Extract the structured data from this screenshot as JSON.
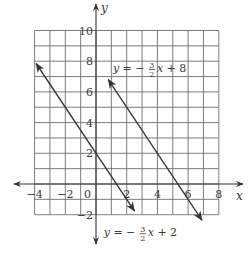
{
  "chart_data": {
    "type": "line",
    "title": "",
    "xlabel": "x",
    "ylabel": "y",
    "xlim": [
      -4,
      8
    ],
    "ylim": [
      -2,
      10
    ],
    "grid": true,
    "grid_step": 1,
    "x_ticks": [
      {
        "value": -4,
        "label": "−4"
      },
      {
        "value": -2,
        "label": "−2"
      },
      {
        "value": 0,
        "label": "0"
      },
      {
        "value": 2,
        "label": "2"
      },
      {
        "value": 4,
        "label": "4"
      },
      {
        "value": 6,
        "label": "6"
      },
      {
        "value": 8,
        "label": "8"
      }
    ],
    "y_ticks": [
      {
        "value": -2,
        "label": "−2"
      },
      {
        "value": 2,
        "label": "2"
      },
      {
        "value": 4,
        "label": "4"
      },
      {
        "value": 6,
        "label": "6"
      },
      {
        "value": 8,
        "label": "8"
      },
      {
        "value": 10,
        "label": "10"
      }
    ],
    "series": [
      {
        "name": "y = -3/2 x + 8",
        "slope": -1.5,
        "intercept": 8,
        "x_range": [
          0.8,
          6.9
        ],
        "label": {
          "lhs": "y",
          "sign": "= −",
          "num": "3",
          "den": "2",
          "rhs_var": "x",
          "rhs_const": "+ 8",
          "anchor_x": 1.1,
          "anchor_y": 7.3
        }
      },
      {
        "name": "y = -3/2 x + 2",
        "slope": -1.5,
        "intercept": 2,
        "x_range": [
          -3.9,
          2.5
        ],
        "label": {
          "lhs": "y",
          "sign": "= −",
          "num": "3",
          "den": "2",
          "rhs_var": "x",
          "rhs_const": "+ 2",
          "anchor_x": 0.5,
          "anchor_y": -3.4
        }
      }
    ]
  }
}
